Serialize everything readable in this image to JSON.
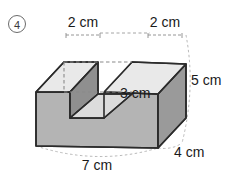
{
  "problem": {
    "item_number": "4"
  },
  "figure": {
    "shape_name": "u-shaped-rectangular-prism",
    "colors": {
      "face_front": "#b4b4b4",
      "face_top": "#e9e9e9",
      "face_side_right": "#9a9a9a",
      "face_notch_left": "#8f8f8f",
      "face_notch_floor": "#dcdcdc",
      "face_notch_back": "#ffffff",
      "outline": "#2b2b2b",
      "dashed_hidden": "#8a8a8a",
      "dimension_guide": "#a8a8a8",
      "background": "#ffffff"
    },
    "dimensions": [
      {
        "id": "top-left-width",
        "label": "2 cm",
        "value": 2,
        "unit": "cm"
      },
      {
        "id": "top-right-width",
        "label": "2 cm",
        "value": 2,
        "unit": "cm"
      },
      {
        "id": "notch-depth-height",
        "label": "3 cm",
        "value": 3,
        "unit": "cm"
      },
      {
        "id": "total-height",
        "label": "5 cm",
        "value": 5,
        "unit": "cm"
      },
      {
        "id": "total-depth",
        "label": "4 cm",
        "value": 4,
        "unit": "cm"
      },
      {
        "id": "total-width",
        "label": "7 cm",
        "value": 7,
        "unit": "cm"
      }
    ]
  }
}
